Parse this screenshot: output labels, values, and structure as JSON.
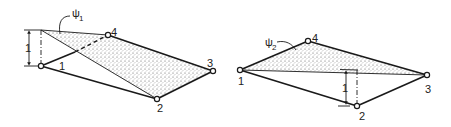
{
  "figures": [
    {
      "id": "left",
      "shape_label": "ψ",
      "shape_sub": "1",
      "nodes": [
        {
          "label": "1"
        },
        {
          "label": "2"
        },
        {
          "label": "3"
        },
        {
          "label": "4"
        }
      ],
      "dimension_label": "1"
    },
    {
      "id": "right",
      "shape_label": "ψ",
      "shape_sub": "2",
      "nodes": [
        {
          "label": "1"
        },
        {
          "label": "2"
        },
        {
          "label": "3"
        },
        {
          "label": "4"
        }
      ],
      "dimension_label": "1"
    }
  ],
  "colors": {
    "line": "#1a1a1a",
    "shade": "#bdbdbd",
    "background": "#ffffff"
  }
}
